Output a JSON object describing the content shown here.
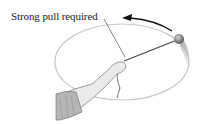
{
  "diagram": {
    "label": "Strong pull required",
    "elements": {
      "orbit": "circular-path-ellipse",
      "ball": "swinging-ball",
      "string": "string",
      "hand": "hand-holding-string",
      "arrow": "direction-of-motion-arrow"
    },
    "colors": {
      "orbit": "#c8c8c8",
      "string": "#444444",
      "ball": "#8a8a8a",
      "arrow": "#111111",
      "arm": "#e4e4e4"
    }
  }
}
